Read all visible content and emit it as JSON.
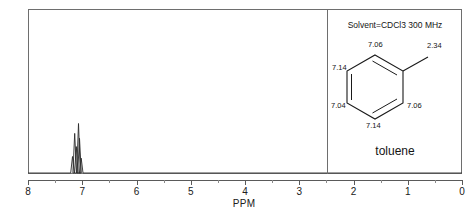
{
  "chart_data": {
    "type": "line",
    "title": "",
    "xlabel": "PPM",
    "ylabel": "",
    "xlim": [
      8,
      0
    ],
    "grid": false,
    "axis_direction": "reversed",
    "major_ticks": [
      8,
      7,
      6,
      5,
      4,
      3,
      2,
      1,
      0
    ],
    "tick_labels": [
      "8",
      "7",
      "6",
      "5",
      "4",
      "3",
      "2",
      "1",
      "0"
    ],
    "minor_tick_interval": 0.5,
    "peaks": [
      {
        "ppm": 7.18,
        "height": 0.1,
        "assignment": "aromatic"
      },
      {
        "ppm": 7.14,
        "height": 0.24,
        "assignment": "aromatic"
      },
      {
        "ppm": 7.11,
        "height": 0.16,
        "assignment": "aromatic"
      },
      {
        "ppm": 7.07,
        "height": 0.3,
        "assignment": "aromatic"
      },
      {
        "ppm": 7.05,
        "height": 0.21,
        "assignment": "aromatic"
      },
      {
        "ppm": 7.02,
        "height": 0.09,
        "assignment": "aromatic"
      }
    ],
    "series": [
      {
        "name": "1H NMR spectrum",
        "x": [
          8,
          7.3,
          7.18,
          7.14,
          7.11,
          7.07,
          7.05,
          7.02,
          6.9,
          0
        ],
        "values": [
          0,
          0,
          0.1,
          0.24,
          0.16,
          0.3,
          0.21,
          0.09,
          0,
          0
        ]
      }
    ]
  },
  "axis": {
    "label": "PPM",
    "ticks": [
      "8",
      "7",
      "6",
      "5",
      "4",
      "3",
      "2",
      "1",
      "0"
    ]
  },
  "inset": {
    "solvent_line": "Solvent=CDCl3 300 MHz",
    "compound_name": "toluene",
    "shifts": {
      "top_left": "7.14",
      "top": "7.06",
      "methyl": "2.34",
      "bottom_left": "7.04",
      "bottom": "7.14",
      "bottom_right": "7.06"
    }
  },
  "colors": {
    "frame": "#6e6e6e",
    "axis": "#5a5a5a",
    "trace": "#2a2a2a",
    "text": "#141414"
  }
}
